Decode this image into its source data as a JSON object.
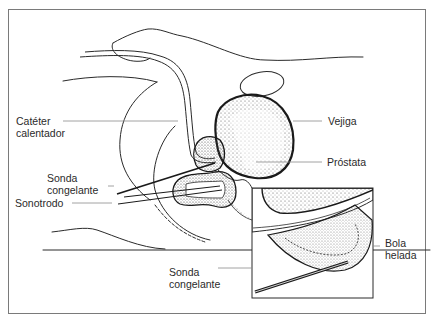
{
  "diagram": {
    "type": "anatomical-illustration",
    "labels": {
      "cateter_line1": "Catéter",
      "cateter_line2": "calentador",
      "vejiga": "Vejiga",
      "prostata": "Próstata",
      "sonda1_line1": "Sonda",
      "sonda1_line2": "congelante",
      "sonotrodo": "Sonotrodo",
      "sonda2_line1": "Sonda",
      "sonda2_line2": "congelante",
      "bola_line1": "Bola",
      "bola_line2": "helada"
    },
    "colors": {
      "line": "#2a2a2a",
      "leader": "#8a8a8a",
      "frame": "#7a7a7a",
      "stipple": "#555555",
      "background": "#ffffff"
    }
  }
}
